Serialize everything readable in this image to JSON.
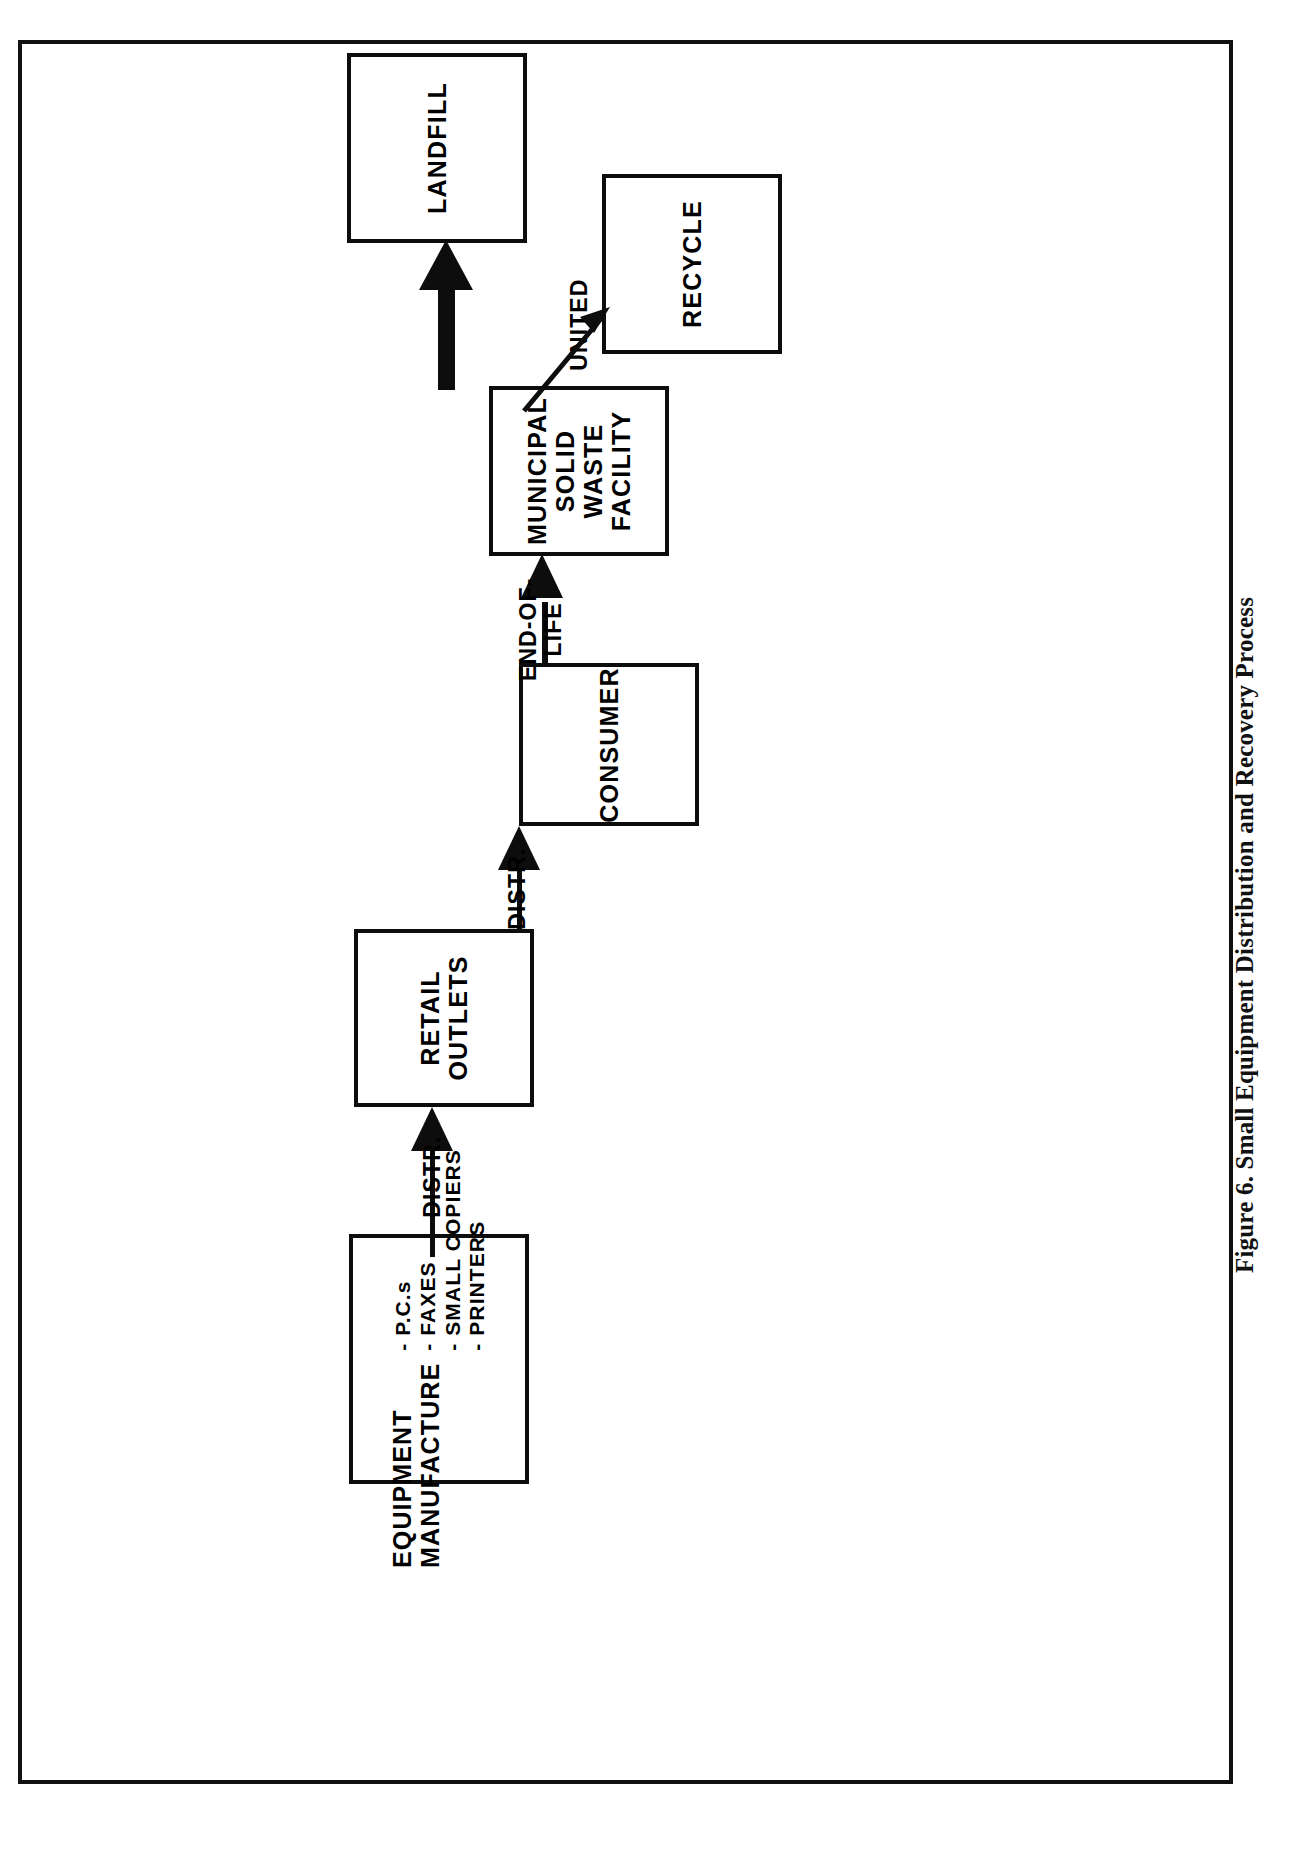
{
  "figure": {
    "caption": "Figure 6. Small Equipment Distribution and Recovery Process"
  },
  "diagram": {
    "type": "flowchart",
    "orientation": "rotated-90-ccw",
    "nodes": [
      {
        "id": "equipment-manufacture",
        "title_line1": "EQUIPMENT",
        "title_line2": "MANUFACTURE",
        "bullets": [
          "- P.C.s",
          "- FAXES",
          "- SMALL COPIERS",
          "- PRINTERS"
        ]
      },
      {
        "id": "retail-outlets",
        "line1": "RETAIL",
        "line2": "OUTLETS"
      },
      {
        "id": "consumer",
        "line1": "CONSUMER"
      },
      {
        "id": "municipal-solid-waste-facility",
        "line1": "MUNICIPAL",
        "line2": "SOLID",
        "line3": "WASTE",
        "line4": "FACILITY"
      },
      {
        "id": "landfill",
        "line1": "LANDFILL"
      },
      {
        "id": "recycle",
        "line1": "RECYCLE"
      }
    ],
    "edges": [
      {
        "id": "mfg-to-retail",
        "label": "DISTR.",
        "from": "equipment-manufacture",
        "to": "retail-outlets",
        "style": "thin-arrow"
      },
      {
        "id": "retail-to-consumer",
        "label": "DISTR.",
        "from": "retail-outlets",
        "to": "consumer",
        "style": "thin-arrow"
      },
      {
        "id": "consumer-to-msw",
        "label_line1": "END-OF-",
        "label_line2": "LIFE",
        "from": "consumer",
        "to": "municipal-solid-waste-facility",
        "style": "thin-arrow"
      },
      {
        "id": "msw-to-landfill",
        "label": "UNITED",
        "from": "municipal-solid-waste-facility",
        "to": "landfill",
        "style": "thick-arrow"
      },
      {
        "id": "msw-to-recycle",
        "label": "",
        "from": "municipal-solid-waste-facility",
        "to": "recycle",
        "style": "diagonal-thin-arrow"
      }
    ]
  },
  "colors": {
    "ink": "#0d0d0d",
    "paper": "#ffffff",
    "frame": "#111111"
  }
}
